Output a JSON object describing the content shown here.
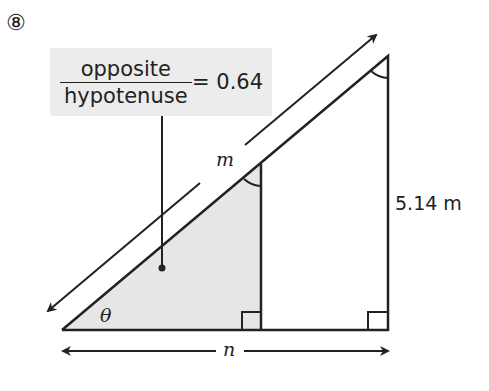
{
  "question_number": "⑧",
  "callout": {
    "numerator": "opposite",
    "denominator": "hypotenuse",
    "equals": "= 0.64"
  },
  "labels": {
    "hypotenuse": "m",
    "base": "n",
    "angle": "θ",
    "opposite_side": "5.14 m"
  },
  "colors": {
    "line": "#222222",
    "shade": "#e6e6e6",
    "callout_bg": "#ececec"
  }
}
